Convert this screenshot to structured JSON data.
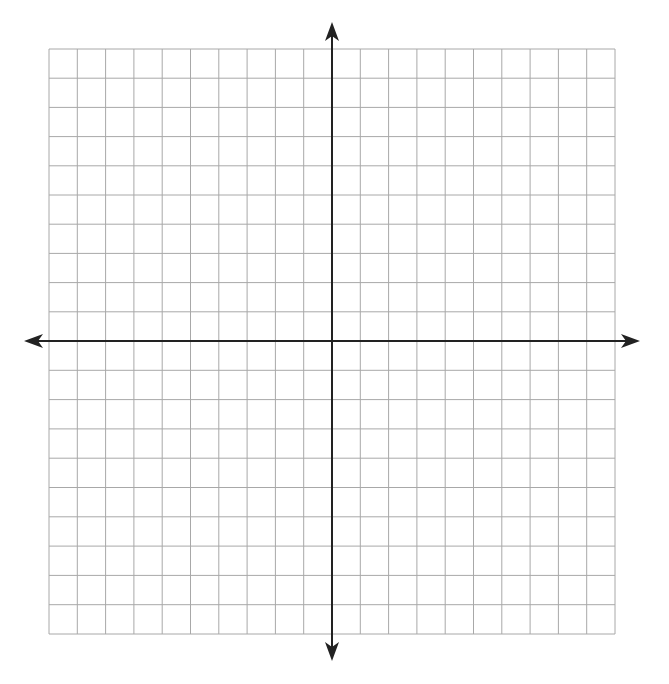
{
  "graph": {
    "type": "coordinate-plane",
    "columns": 20,
    "rows": 20,
    "grid_left": 49,
    "grid_top": 49,
    "grid_right": 615,
    "grid_bottom": 634,
    "origin_x": 332,
    "origin_y": 341,
    "x_arrow_left": 24,
    "x_arrow_right": 640,
    "y_arrow_top": 22,
    "y_arrow_bottom": 661,
    "colors": {
      "background": "#ffffff",
      "grid_line": "#a8a8a8",
      "axis": "#222222"
    }
  }
}
